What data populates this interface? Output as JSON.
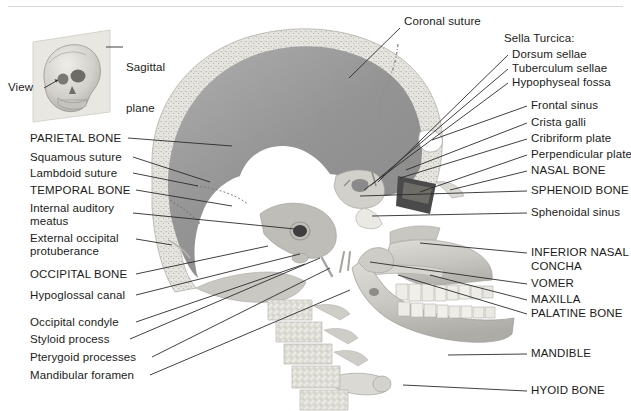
{
  "figure": {
    "view_direction_label": "View",
    "inset_label": "Sagittal\nplane",
    "background_color": "#ffffff",
    "leader_line_color": "#2b2b2b",
    "text_color": "#1b1b1b",
    "bone_rim_color": "#e8e6e0",
    "cranial_cavity_color": "#9a9a9a",
    "face_bone_color": "#c9c7c2"
  },
  "inset": {
    "name": "sagittal-plane-inset",
    "plane_label": "Sagittal plane",
    "view_label": "View"
  },
  "labels_left": [
    {
      "id": "parietal-bone",
      "text": "PARIETAL BONE",
      "caps": true,
      "x": 30,
      "y": 142
    },
    {
      "id": "squamous-suture",
      "text": "Squamous suture",
      "caps": false,
      "x": 30,
      "y": 161
    },
    {
      "id": "lambdoid-suture",
      "text": "Lambdoid suture",
      "caps": false,
      "x": 30,
      "y": 177
    },
    {
      "id": "temporal-bone",
      "text": "TEMPORAL BONE",
      "caps": true,
      "x": 30,
      "y": 194
    },
    {
      "id": "internal-auditory-meatus",
      "text": "Internal auditory",
      "caps": false,
      "x": 30,
      "y": 212
    },
    {
      "id": "internal-auditory-meatus-2",
      "text": "meatus",
      "caps": false,
      "x": 30,
      "y": 225
    },
    {
      "id": "external-occipital",
      "text": "External occipital",
      "caps": false,
      "x": 30,
      "y": 242
    },
    {
      "id": "external-occipital-2",
      "text": "protuberance",
      "caps": false,
      "x": 30,
      "y": 255
    },
    {
      "id": "occipital-bone",
      "text": "OCCIPITAL BONE",
      "caps": true,
      "x": 30,
      "y": 278
    },
    {
      "id": "hypoglossal-canal",
      "text": "Hypoglossal canal",
      "caps": false,
      "x": 30,
      "y": 299
    },
    {
      "id": "occipital-condyle",
      "text": "Occipital condyle",
      "caps": false,
      "x": 30,
      "y": 326
    },
    {
      "id": "styloid-process",
      "text": "Styloid process",
      "caps": false,
      "x": 30,
      "y": 343
    },
    {
      "id": "pterygoid-processes",
      "text": "Pterygoid processes",
      "caps": false,
      "x": 30,
      "y": 361
    },
    {
      "id": "mandibular-foramen",
      "text": "Mandibular foramen",
      "caps": false,
      "x": 30,
      "y": 379
    }
  ],
  "labels_right": [
    {
      "id": "coronal-suture",
      "text": "Coronal suture",
      "caps": false,
      "x": 404,
      "y": 25,
      "indent": false
    },
    {
      "id": "sella-turcica",
      "text": "Sella Turcica:",
      "caps": false,
      "x": 504,
      "y": 42,
      "indent": false
    },
    {
      "id": "dorsum-sellae",
      "text": "Dorsum sellae",
      "caps": false,
      "x": 512,
      "y": 58,
      "indent": true
    },
    {
      "id": "tuberculum-sellae",
      "text": "Tuberculum sellae",
      "caps": false,
      "x": 512,
      "y": 72,
      "indent": true
    },
    {
      "id": "hypophyseal-fossa",
      "text": "Hypophyseal fossa",
      "caps": false,
      "x": 512,
      "y": 86,
      "indent": true
    },
    {
      "id": "frontal-sinus",
      "text": "Frontal sinus",
      "caps": false,
      "x": 531,
      "y": 109,
      "indent": false
    },
    {
      "id": "crista-galli",
      "text": "Crista galli",
      "caps": false,
      "x": 531,
      "y": 126,
      "indent": false
    },
    {
      "id": "cribriform-plate",
      "text": "Cribriform plate",
      "caps": false,
      "x": 531,
      "y": 142,
      "indent": false
    },
    {
      "id": "perpendicular-plate",
      "text": "Perpendicular plate",
      "caps": false,
      "x": 531,
      "y": 158,
      "indent": false
    },
    {
      "id": "nasal-bone",
      "text": "NASAL BONE",
      "caps": true,
      "x": 531,
      "y": 174,
      "indent": false
    },
    {
      "id": "sphenoid-bone",
      "text": "SPHENOID BONE",
      "caps": true,
      "x": 531,
      "y": 194,
      "indent": false
    },
    {
      "id": "sphenoidal-sinus",
      "text": "Sphenoidal sinus",
      "caps": false,
      "x": 531,
      "y": 216,
      "indent": false
    },
    {
      "id": "inferior-nasal-concha",
      "text": "INFERIOR NASAL",
      "caps": true,
      "x": 531,
      "y": 256,
      "indent": false
    },
    {
      "id": "inferior-nasal-concha-2",
      "text": "CONCHA",
      "caps": true,
      "x": 531,
      "y": 270,
      "indent": false
    },
    {
      "id": "vomer",
      "text": "VOMER",
      "caps": true,
      "x": 531,
      "y": 287,
      "indent": false
    },
    {
      "id": "maxilla",
      "text": "MAXILLA",
      "caps": true,
      "x": 531,
      "y": 303,
      "indent": false
    },
    {
      "id": "palatine-bone",
      "text": "PALATINE BONE",
      "caps": true,
      "x": 531,
      "y": 317,
      "indent": false
    },
    {
      "id": "mandible",
      "text": "MANDIBLE",
      "caps": true,
      "x": 531,
      "y": 357,
      "indent": false
    },
    {
      "id": "hyoid-bone",
      "text": "HYOID BONE",
      "caps": true,
      "x": 531,
      "y": 394,
      "indent": false
    }
  ],
  "leaders_left": [
    {
      "id": "parietal-bone",
      "x1": 128,
      "y1": 138,
      "x2": 232,
      "y2": 146
    },
    {
      "id": "squamous-suture",
      "x1": 133,
      "y1": 157,
      "x2": 210,
      "y2": 182
    },
    {
      "id": "lambdoid-suture",
      "x1": 133,
      "y1": 173,
      "x2": 198,
      "y2": 186
    },
    {
      "id": "temporal-bone",
      "x1": 136,
      "y1": 190,
      "x2": 232,
      "y2": 206
    },
    {
      "id": "internal-auditory-meatus",
      "x1": 133,
      "y1": 213,
      "x2": 295,
      "y2": 229
    },
    {
      "id": "external-occipital",
      "x1": 136,
      "y1": 239,
      "x2": 172,
      "y2": 245
    },
    {
      "id": "occipital-bone",
      "x1": 136,
      "y1": 274,
      "x2": 268,
      "y2": 246
    },
    {
      "id": "hypoglossal-canal",
      "x1": 136,
      "y1": 295,
      "x2": 300,
      "y2": 254
    },
    {
      "id": "occipital-condyle",
      "x1": 136,
      "y1": 322,
      "x2": 305,
      "y2": 264
    },
    {
      "id": "styloid-process",
      "x1": 130,
      "y1": 339,
      "x2": 320,
      "y2": 258
    },
    {
      "id": "pterygoid-processes",
      "x1": 152,
      "y1": 357,
      "x2": 330,
      "y2": 268
    },
    {
      "id": "mandibular-foramen",
      "x1": 150,
      "y1": 375,
      "x2": 350,
      "y2": 290
    }
  ],
  "leaders_right": [
    {
      "id": "coronal-suture",
      "x1": 400,
      "y1": 28,
      "x2": 349,
      "y2": 78
    },
    {
      "id": "dorsum-sellae",
      "x1": 508,
      "y1": 55,
      "x2": 378,
      "y2": 182
    },
    {
      "id": "tuberculum-sellae",
      "x1": 508,
      "y1": 69,
      "x2": 370,
      "y2": 186
    },
    {
      "id": "hypophyseal-fossa",
      "x1": 508,
      "y1": 83,
      "x2": 364,
      "y2": 190
    },
    {
      "id": "frontal-sinus",
      "x1": 527,
      "y1": 106,
      "x2": 432,
      "y2": 140
    },
    {
      "id": "crista-galli",
      "x1": 527,
      "y1": 123,
      "x2": 406,
      "y2": 170
    },
    {
      "id": "cribriform-plate",
      "x1": 527,
      "y1": 139,
      "x2": 400,
      "y2": 178
    },
    {
      "id": "perpendicular-plate",
      "x1": 527,
      "y1": 155,
      "x2": 420,
      "y2": 192
    },
    {
      "id": "nasal-bone",
      "x1": 527,
      "y1": 171,
      "x2": 450,
      "y2": 190
    },
    {
      "id": "sphenoid-bone",
      "x1": 527,
      "y1": 191,
      "x2": 360,
      "y2": 196
    },
    {
      "id": "sphenoidal-sinus",
      "x1": 527,
      "y1": 213,
      "x2": 372,
      "y2": 216
    },
    {
      "id": "inferior-nasal-concha",
      "x1": 527,
      "y1": 253,
      "x2": 420,
      "y2": 243
    },
    {
      "id": "vomer",
      "x1": 527,
      "y1": 284,
      "x2": 370,
      "y2": 262
    },
    {
      "id": "maxilla",
      "x1": 527,
      "y1": 300,
      "x2": 430,
      "y2": 275
    },
    {
      "id": "palatine-bone",
      "x1": 527,
      "y1": 314,
      "x2": 398,
      "y2": 275
    },
    {
      "id": "mandible",
      "x1": 527,
      "y1": 354,
      "x2": 448,
      "y2": 355
    },
    {
      "id": "hyoid-bone",
      "x1": 527,
      "y1": 391,
      "x2": 403,
      "y2": 385
    }
  ],
  "inset_leaders": [
    {
      "id": "sagittal-plane-leader",
      "x1": 106,
      "y1": 47,
      "x2": 123,
      "y2": 47
    },
    {
      "id": "view-leader",
      "x1": 44,
      "y1": 88,
      "x2": 58,
      "y2": 78
    }
  ]
}
